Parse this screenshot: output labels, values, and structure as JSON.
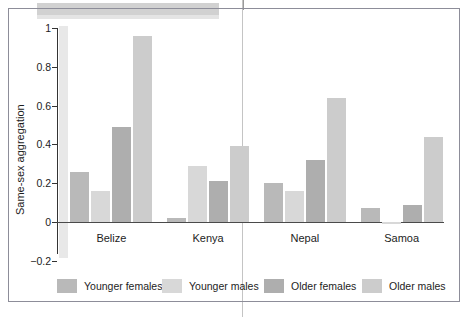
{
  "figure": {
    "frame_color": "#8d8d99",
    "background": "#ffffff"
  },
  "chart_data": {
    "type": "bar",
    "title": "",
    "xlabel": "",
    "ylabel": "Same-sex aggregation",
    "categories": [
      "Belize",
      "Kenya",
      "Nepal",
      "Samoa"
    ],
    "series": [
      {
        "name": "Younger females",
        "color": "#b9b9b9",
        "values": [
          0.26,
          0.02,
          0.2,
          0.07
        ]
      },
      {
        "name": "Younger males",
        "color": "#d8d8d8",
        "values": [
          0.16,
          0.29,
          0.16,
          -0.01
        ]
      },
      {
        "name": "Older females",
        "color": "#aeaeae",
        "values": [
          0.49,
          0.21,
          0.32,
          0.09
        ]
      },
      {
        "name": "Older males",
        "color": "#cccccc",
        "values": [
          0.96,
          0.39,
          0.64,
          0.44
        ]
      }
    ],
    "ylim": [
      -0.2,
      1
    ],
    "yticks": [
      1,
      0.8,
      0.6,
      0.4,
      0.2,
      0,
      -0.2
    ],
    "ytick_labels": [
      "1",
      "0.8",
      "0.6",
      "0.4",
      "0.2",
      "0",
      "−0.2"
    ],
    "grid": false,
    "legend_position": "bottom"
  }
}
